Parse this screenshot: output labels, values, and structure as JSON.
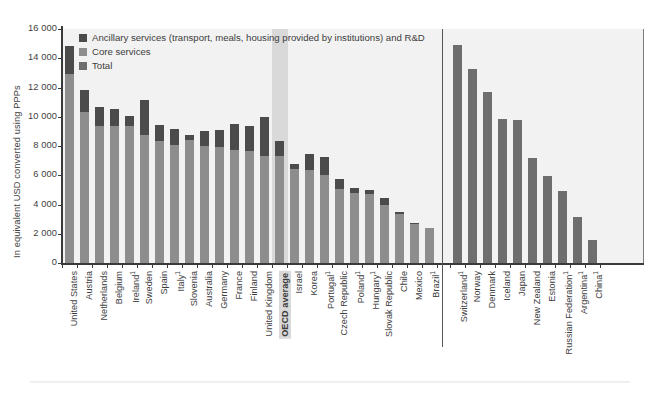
{
  "chart_data": {
    "type": "bar",
    "title": "",
    "xlabel": "",
    "ylabel": "In equivalent USD converted using PPPs",
    "ylim": [
      0,
      16000
    ],
    "yticks": [
      "0",
      "2 000",
      "4 000",
      "6 000",
      "8 000",
      "10 000",
      "12 000",
      "14 000",
      "16 000"
    ],
    "grid": false,
    "legend_position": "top-left",
    "legend": [
      {
        "key": "ancillary",
        "label": "Ancillary services (transport, meals, housing provided by institutions) and R&D",
        "color": "#4b4b4b"
      },
      {
        "key": "core",
        "label": "Core services",
        "color": "#8d8d8d"
      },
      {
        "key": "total",
        "label": "Total",
        "color": "#6e6e6e"
      }
    ],
    "panels": [
      {
        "name": "stacked-panel",
        "stacked": true,
        "categories": [
          {
            "label": "United States",
            "footnote": "",
            "core": 12900,
            "ancillary": 1950,
            "total": 14850,
            "highlight": false
          },
          {
            "label": "Austria",
            "footnote": "",
            "core": 10300,
            "ancillary": 1500,
            "total": 11800,
            "highlight": false
          },
          {
            "label": "Netherlands",
            "footnote": "",
            "core": 9350,
            "ancillary": 1350,
            "total": 10700,
            "highlight": false
          },
          {
            "label": "Belgium",
            "footnote": "",
            "core": 9400,
            "ancillary": 1150,
            "total": 10550,
            "highlight": false
          },
          {
            "label": "Ireland",
            "footnote": "1",
            "core": 9350,
            "ancillary": 700,
            "total": 10050,
            "highlight": false
          },
          {
            "label": "Sweden",
            "footnote": "",
            "core": 8750,
            "ancillary": 2400,
            "total": 11150,
            "highlight": false
          },
          {
            "label": "Spain",
            "footnote": "",
            "core": 8350,
            "ancillary": 1100,
            "total": 9450,
            "highlight": false
          },
          {
            "label": "Italy",
            "footnote": "1",
            "core": 8100,
            "ancillary": 1050,
            "total": 9150,
            "highlight": false
          },
          {
            "label": "Slovenia",
            "footnote": "",
            "core": 8400,
            "ancillary": 350,
            "total": 8750,
            "highlight": false
          },
          {
            "label": "Australia",
            "footnote": "",
            "core": 8000,
            "ancillary": 1050,
            "total": 9050,
            "highlight": false
          },
          {
            "label": "Germany",
            "footnote": "",
            "core": 7950,
            "ancillary": 1150,
            "total": 9100,
            "highlight": false
          },
          {
            "label": "France",
            "footnote": "",
            "core": 7750,
            "ancillary": 1750,
            "total": 9500,
            "highlight": false
          },
          {
            "label": "Finland",
            "footnote": "",
            "core": 7650,
            "ancillary": 1750,
            "total": 9400,
            "highlight": false
          },
          {
            "label": "United Kingdom",
            "footnote": "",
            "core": 7350,
            "ancillary": 2650,
            "total": 10000,
            "highlight": false
          },
          {
            "label": "OECD average",
            "footnote": "",
            "core": 7300,
            "ancillary": 1050,
            "total": 8350,
            "highlight": true
          },
          {
            "label": "Israel",
            "footnote": "",
            "core": 6400,
            "ancillary": 400,
            "total": 6800,
            "highlight": false
          },
          {
            "label": "Korea",
            "footnote": "",
            "core": 6350,
            "ancillary": 1100,
            "total": 7450,
            "highlight": false
          },
          {
            "label": "Portugal",
            "footnote": "1",
            "core": 6000,
            "ancillary": 1250,
            "total": 7250,
            "highlight": false
          },
          {
            "label": "Czech Republic",
            "footnote": "",
            "core": 5050,
            "ancillary": 700,
            "total": 5750,
            "highlight": false
          },
          {
            "label": "Poland",
            "footnote": "1",
            "core": 4800,
            "ancillary": 350,
            "total": 5150,
            "highlight": false
          },
          {
            "label": "Hungary",
            "footnote": "1",
            "core": 4750,
            "ancillary": 250,
            "total": 5000,
            "highlight": false
          },
          {
            "label": "Slovak Republic",
            "footnote": "",
            "core": 3950,
            "ancillary": 500,
            "total": 4450,
            "highlight": false
          },
          {
            "label": "Chile",
            "footnote": "",
            "core": 3350,
            "ancillary": 150,
            "total": 3500,
            "highlight": false
          },
          {
            "label": "Mexico",
            "footnote": "",
            "core": 2700,
            "ancillary": 50,
            "total": 2750,
            "highlight": false
          },
          {
            "label": "Brazil",
            "footnote": "1",
            "core": 2400,
            "ancillary": 0,
            "total": 2400,
            "highlight": false
          }
        ]
      },
      {
        "name": "total-only-panel",
        "stacked": false,
        "categories": [
          {
            "label": "Switzerland",
            "footnote": "1",
            "total": 14900
          },
          {
            "label": "Norway",
            "footnote": "",
            "total": 13250
          },
          {
            "label": "Denmark",
            "footnote": "",
            "total": 11700
          },
          {
            "label": "Iceland",
            "footnote": "",
            "total": 9850
          },
          {
            "label": "Japan",
            "footnote": "",
            "total": 9750
          },
          {
            "label": "New Zealand",
            "footnote": "",
            "total": 7150
          },
          {
            "label": "Estonia",
            "footnote": "",
            "total": 5950
          },
          {
            "label": "Russian Federation",
            "footnote": "1",
            "total": 4900
          },
          {
            "label": "Argentina",
            "footnote": "1",
            "total": 3150
          },
          {
            "label": "China",
            "footnote": "1",
            "total": 1550
          }
        ]
      }
    ]
  },
  "colors": {
    "ancillary": "#4b4b4b",
    "core": "#8d8d8d",
    "total": "#6e6e6e",
    "plot_background": "#f2f2f2",
    "highlight_band": "#d9d9d9",
    "axis": "#3a3a3a"
  }
}
